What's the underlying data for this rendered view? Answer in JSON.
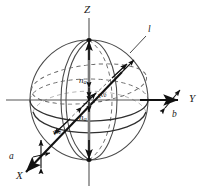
{
  "figure": {
    "type": "optical-indicatrix-sphere",
    "background_color": "#ffffff",
    "line_color": "#3b3b3b",
    "bold_line_color": "#111111",
    "axes": {
      "z_label": "Z",
      "y_label": "Y",
      "x_label": "X"
    },
    "vectors": {
      "na_upper_label": "n",
      "na_upper_sub": "a",
      "na_lower_label": "n",
      "na_lower_sub": "a",
      "nb_upper_label": "n",
      "nb_upper_sub": "b",
      "nb_lower_label": "n",
      "nb_lower_sub": "b"
    },
    "annotations": {
      "a_label": "a",
      "b_label": "b",
      "l_label": "l"
    },
    "geometry": {
      "center_x": 89,
      "center_y": 100,
      "sphere_radius_x": 59,
      "sphere_radius_y": 60,
      "equator_ry": 21,
      "meridian_rx": 22,
      "dashed_ellipse_ry": 26
    }
  }
}
